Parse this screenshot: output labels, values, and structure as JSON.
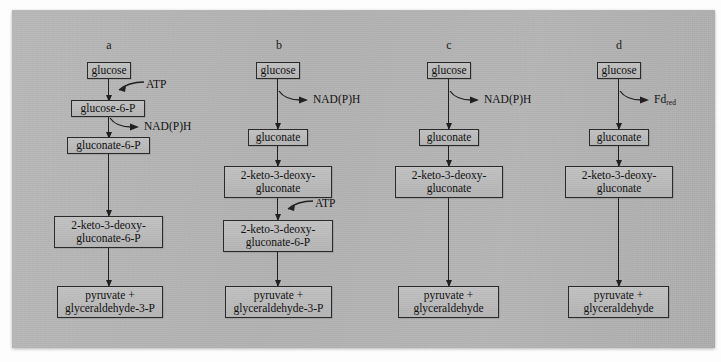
{
  "figure": {
    "plate_color": "#b5b5b5",
    "box_color": "#bcbcbc",
    "stroke_color": "#202020"
  },
  "columns": [
    {
      "id": "a",
      "label": "a",
      "nodes": [
        {
          "name": "glucose",
          "text": "glucose"
        },
        {
          "name": "glucose-6-p",
          "text": "glucose-6-P"
        },
        {
          "name": "gluconate-6-p",
          "text": "gluconate-6-P"
        },
        {
          "name": "kdpg",
          "text": "2-keto-3-deoxy-\ngluconate-6-P"
        },
        {
          "name": "products",
          "text": "pyruvate +\nglyceraldehyde-3-P"
        }
      ],
      "cofactors": [
        {
          "name": "atp",
          "text": "ATP",
          "sub": "",
          "direction": "in"
        },
        {
          "name": "nadph",
          "text": "NAD(P)H",
          "sub": "",
          "direction": "out"
        }
      ]
    },
    {
      "id": "b",
      "label": "b",
      "nodes": [
        {
          "name": "glucose",
          "text": "glucose"
        },
        {
          "name": "gluconate",
          "text": "gluconate"
        },
        {
          "name": "kdg",
          "text": "2-keto-3-deoxy-\ngluconate"
        },
        {
          "name": "kdpg",
          "text": "2-keto-3-deoxy-\ngluconate-6-P"
        },
        {
          "name": "products",
          "text": "pyruvate +\nglyceraldehyde-3-P"
        }
      ],
      "cofactors": [
        {
          "name": "nadph",
          "text": "NAD(P)H",
          "sub": "",
          "direction": "out"
        },
        {
          "name": "atp",
          "text": "ATP",
          "sub": "",
          "direction": "in"
        }
      ]
    },
    {
      "id": "c",
      "label": "c",
      "nodes": [
        {
          "name": "glucose",
          "text": "glucose"
        },
        {
          "name": "gluconate",
          "text": "gluconate"
        },
        {
          "name": "kdg",
          "text": "2-keto-3-deoxy-\ngluconate"
        },
        {
          "name": "products",
          "text": "pyruvate +\nglyceraldehyde"
        }
      ],
      "cofactors": [
        {
          "name": "nadph",
          "text": "NAD(P)H",
          "sub": "",
          "direction": "out"
        }
      ]
    },
    {
      "id": "d",
      "label": "d",
      "nodes": [
        {
          "name": "glucose",
          "text": "glucose"
        },
        {
          "name": "gluconate",
          "text": "gluconate"
        },
        {
          "name": "kdg",
          "text": "2-keto-3-deoxy-\ngluconate"
        },
        {
          "name": "products",
          "text": "pyruvate +\nglyceraldehyde"
        }
      ],
      "cofactors": [
        {
          "name": "fd-red",
          "text": "Fd",
          "sub": "red",
          "direction": "out"
        }
      ]
    }
  ]
}
